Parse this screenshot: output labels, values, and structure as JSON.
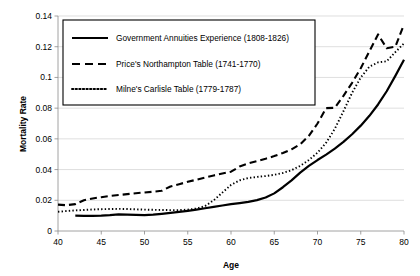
{
  "chart_data": {
    "type": "line",
    "title": "",
    "xlabel": "Age",
    "ylabel": "Mortality Rate",
    "xlim": [
      40,
      80
    ],
    "ylim": [
      0,
      0.14
    ],
    "grid": true,
    "legend_position": "top-left",
    "xticks": [
      "40",
      "45",
      "50",
      "55",
      "60",
      "65",
      "70",
      "75",
      "80"
    ],
    "xtick_values": [
      40,
      45,
      50,
      55,
      60,
      65,
      70,
      75,
      80
    ],
    "yticks": [
      "0",
      "0.02",
      "0.04",
      "0.06",
      "0.08",
      "0.1",
      "0.12",
      "0.14"
    ],
    "ytick_values": [
      0,
      0.02,
      0.04,
      0.06,
      0.08,
      0.1,
      0.12,
      0.14
    ],
    "series": [
      {
        "name": "Government Annuities Experience (1808-1826)",
        "style": "solid",
        "color": "#000000",
        "x": [
          42,
          43,
          44,
          45,
          46,
          47,
          48,
          49,
          50,
          51,
          52,
          53,
          54,
          55,
          56,
          57,
          58,
          59,
          60,
          61,
          62,
          63,
          64,
          65,
          66,
          67,
          68,
          69,
          70,
          71,
          72,
          73,
          74,
          75,
          76,
          77,
          78,
          79,
          80
        ],
        "y": [
          0.01,
          0.0099,
          0.0099,
          0.01,
          0.0103,
          0.0108,
          0.0107,
          0.0105,
          0.0104,
          0.0107,
          0.0112,
          0.0118,
          0.0124,
          0.0131,
          0.0139,
          0.0148,
          0.0157,
          0.0166,
          0.0175,
          0.0182,
          0.019,
          0.0201,
          0.0218,
          0.0245,
          0.0285,
          0.033,
          0.038,
          0.0424,
          0.0462,
          0.0497,
          0.0536,
          0.058,
          0.063,
          0.0686,
          0.075,
          0.0824,
          0.091,
          0.101,
          0.1115
        ]
      },
      {
        "name": "Price's Northampton Table (1741-1770)",
        "style": "dashed",
        "color": "#000000",
        "x": [
          40,
          41,
          42,
          43,
          44,
          45,
          46,
          47,
          48,
          49,
          50,
          51,
          52,
          53,
          54,
          55,
          56,
          57,
          58,
          59,
          60,
          61,
          62,
          63,
          64,
          65,
          66,
          67,
          68,
          69,
          70,
          71,
          72,
          73,
          74,
          75,
          76,
          77,
          78,
          79,
          80
        ],
        "y": [
          0.0172,
          0.0168,
          0.0175,
          0.02,
          0.0212,
          0.022,
          0.0228,
          0.0234,
          0.024,
          0.0246,
          0.0251,
          0.0256,
          0.0262,
          0.029,
          0.0305,
          0.032,
          0.0334,
          0.0348,
          0.0362,
          0.0374,
          0.0386,
          0.042,
          0.044,
          0.0455,
          0.047,
          0.0488,
          0.0508,
          0.0532,
          0.0565,
          0.062,
          0.07,
          0.08,
          0.0802,
          0.088,
          0.0965,
          0.106,
          0.117,
          0.128,
          0.119,
          0.12,
          0.1345
        ]
      },
      {
        "name": "Milne's Carlisle Table (1779-1787)",
        "style": "dotted",
        "color": "#000000",
        "x": [
          40,
          41,
          42,
          43,
          44,
          45,
          46,
          47,
          48,
          49,
          50,
          51,
          52,
          53,
          54,
          55,
          56,
          57,
          58,
          59,
          60,
          61,
          62,
          63,
          64,
          65,
          66,
          67,
          68,
          69,
          70,
          71,
          72,
          73,
          74,
          75,
          76,
          77,
          78,
          79,
          80
        ],
        "y": [
          0.0125,
          0.013,
          0.0134,
          0.0137,
          0.014,
          0.0142,
          0.0143,
          0.0144,
          0.0143,
          0.0141,
          0.0139,
          0.0138,
          0.0137,
          0.0136,
          0.0136,
          0.0139,
          0.0146,
          0.0162,
          0.02,
          0.025,
          0.03,
          0.033,
          0.0345,
          0.0352,
          0.0358,
          0.0366,
          0.0378,
          0.0396,
          0.0424,
          0.0462,
          0.051,
          0.0575,
          0.0665,
          0.078,
          0.09,
          0.1,
          0.107,
          0.1098,
          0.1105,
          0.1165,
          0.1222
        ]
      }
    ]
  },
  "legend": {
    "entries": [
      {
        "label": "Government Annuities Experience (1808-1826)",
        "style": "solid"
      },
      {
        "label": "Price's Northampton Table (1741-1770)",
        "style": "dashed"
      },
      {
        "label": "Milne's Carlisle Table (1779-1787)",
        "style": "dotted"
      }
    ]
  },
  "axes": {
    "x_title": "Age",
    "y_title": "Mortality Rate"
  }
}
